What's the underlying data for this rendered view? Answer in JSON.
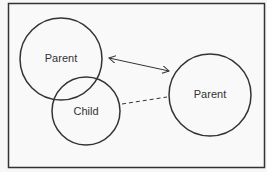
{
  "diagram": {
    "nodes": [
      {
        "id": "parent-left",
        "label": "Parent"
      },
      {
        "id": "child",
        "label": "Child"
      },
      {
        "id": "parent-right",
        "label": "Parent"
      }
    ],
    "edges": [
      {
        "from": "parent-left",
        "to": "parent-right",
        "style": "solid",
        "arrows": "both"
      },
      {
        "from": "child",
        "to": "parent-right",
        "style": "dashed",
        "arrows": "none"
      }
    ]
  }
}
